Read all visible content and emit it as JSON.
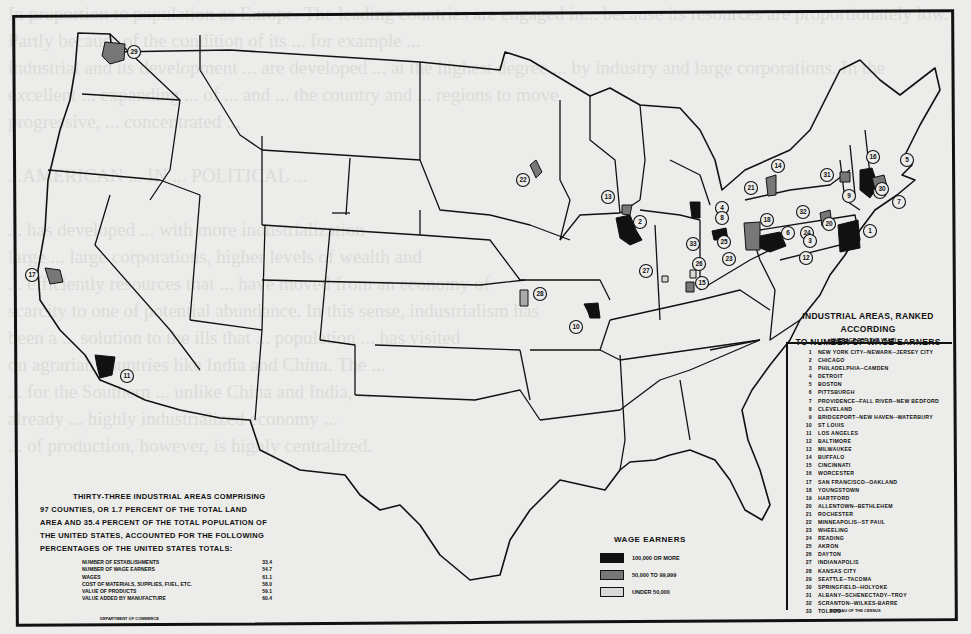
{
  "map": {
    "legend": {
      "title_line1": "INDUSTRIAL AREAS, RANKED ACCORDING",
      "title_line2": "TO NUMBER OF WAGE EARNERS",
      "subtitle": "(AVERAGE FOR THE YEAR)",
      "source": "BUREAU OF THE CENSUS",
      "areas": [
        {
          "rank": "1",
          "name": "NEW YORK CITY--NEWARK--JERSEY CITY"
        },
        {
          "rank": "2",
          "name": "CHICAGO"
        },
        {
          "rank": "3",
          "name": "PHILADELPHIA--CAMDEN"
        },
        {
          "rank": "4",
          "name": "DETROIT"
        },
        {
          "rank": "5",
          "name": "BOSTON"
        },
        {
          "rank": "6",
          "name": "PITTSBURGH"
        },
        {
          "rank": "7",
          "name": "PROVIDENCE--FALL RIVER--NEW BEDFORD"
        },
        {
          "rank": "8",
          "name": "CLEVELAND"
        },
        {
          "rank": "9",
          "name": "BRIDGEPORT--NEW HAVEN--WATERBURY"
        },
        {
          "rank": "10",
          "name": "ST LOUIS"
        },
        {
          "rank": "11",
          "name": "LOS ANGELES"
        },
        {
          "rank": "12",
          "name": "BALTIMORE"
        },
        {
          "rank": "13",
          "name": "MILWAUKEE"
        },
        {
          "rank": "14",
          "name": "BUFFALO"
        },
        {
          "rank": "15",
          "name": "CINCINNATI"
        },
        {
          "rank": "16",
          "name": "WORCESTER"
        },
        {
          "rank": "17",
          "name": "SAN FRANCISCO--OAKLAND"
        },
        {
          "rank": "18",
          "name": "YOUNGSTOWN"
        },
        {
          "rank": "19",
          "name": "HARTFORD"
        },
        {
          "rank": "20",
          "name": "ALLENTOWN--BETHLEHEM"
        },
        {
          "rank": "21",
          "name": "ROCHESTER"
        },
        {
          "rank": "22",
          "name": "MINNEAPOLIS--ST PAUL"
        },
        {
          "rank": "23",
          "name": "WHEELING"
        },
        {
          "rank": "24",
          "name": "READING"
        },
        {
          "rank": "25",
          "name": "AKRON"
        },
        {
          "rank": "26",
          "name": "DAYTON"
        },
        {
          "rank": "27",
          "name": "INDIANAPOLIS"
        },
        {
          "rank": "28",
          "name": "KANSAS CITY"
        },
        {
          "rank": "29",
          "name": "SEATTLE--TACOMA"
        },
        {
          "rank": "30",
          "name": "SPRINGFIELD--HOLYOKE"
        },
        {
          "rank": "31",
          "name": "ALBANY--SCHENECTADY--TROY"
        },
        {
          "rank": "32",
          "name": "SCRANTON--WILKES-BARRE"
        },
        {
          "rank": "33",
          "name": "TOLEDO"
        }
      ]
    },
    "summary": {
      "line1": "THIRTY-THREE INDUSTRIAL AREAS COMPRISING",
      "line2": "97 COUNTIES, OR 1.7 PERCENT OF THE TOTAL LAND",
      "line3": "AREA AND 35.4 PERCENT OF THE TOTAL POPULATION OF",
      "line4": "THE UNITED STATES, ACCOUNTED FOR THE FOLLOWING",
      "line5": "PERCENTAGES OF THE UNITED STATES TOTALS:",
      "stats": [
        {
          "label": "NUMBER OF ESTABLISHMENTS",
          "value": "33.4"
        },
        {
          "label": "NUMBER OF WAGE EARNERS",
          "value": "54.7"
        },
        {
          "label": "WAGES",
          "value": "61.1"
        },
        {
          "label": "COST OF MATERIALS, SUPPLIES, FUEL, ETC.",
          "value": "58.0"
        },
        {
          "label": "VALUE OF PRODUCTS",
          "value": "59.1"
        },
        {
          "label": "VALUE ADDED BY MANUFACTURE",
          "value": "60.4"
        }
      ],
      "source": "DEPARTMENT OF COMMERCE"
    },
    "wage_legend": {
      "title": "WAGE EARNERS",
      "items": [
        {
          "label": "100,000 OR MORE",
          "fill": "#111111"
        },
        {
          "label": "50,000 TO 99,999",
          "fill": "#777777"
        },
        {
          "label": "UNDER 50,000",
          "fill": "#d8d8d6"
        }
      ]
    },
    "markers": [
      {
        "rank": "29",
        "x": 134,
        "y": 52,
        "tier": "gray"
      },
      {
        "rank": "17",
        "x": 32,
        "y": 275,
        "tier": "gray"
      },
      {
        "rank": "11",
        "x": 127,
        "y": 376,
        "tier": "black"
      },
      {
        "rank": "22",
        "x": 523,
        "y": 180,
        "tier": "gray"
      },
      {
        "rank": "13",
        "x": 608,
        "y": 197,
        "tier": "gray"
      },
      {
        "rank": "2",
        "x": 640,
        "y": 222,
        "tier": "black"
      },
      {
        "rank": "28",
        "x": 540,
        "y": 294,
        "tier": "light"
      },
      {
        "rank": "10",
        "x": 576,
        "y": 327,
        "tier": "black"
      },
      {
        "rank": "27",
        "x": 646,
        "y": 271,
        "tier": "light"
      },
      {
        "rank": "15",
        "x": 702,
        "y": 283,
        "tier": "gray"
      },
      {
        "rank": "26",
        "x": 699,
        "y": 264,
        "tier": "light"
      },
      {
        "rank": "33",
        "x": 693,
        "y": 244,
        "tier": "light"
      },
      {
        "rank": "4",
        "x": 722,
        "y": 208,
        "tier": "black"
      },
      {
        "rank": "8",
        "x": 722,
        "y": 218,
        "tier": "black"
      },
      {
        "rank": "25",
        "x": 724,
        "y": 242,
        "tier": "gray"
      },
      {
        "rank": "23",
        "x": 729,
        "y": 259,
        "tier": "light"
      },
      {
        "rank": "18",
        "x": 767,
        "y": 220,
        "tier": "gray"
      },
      {
        "rank": "6",
        "x": 788,
        "y": 233,
        "tier": "black"
      },
      {
        "rank": "21",
        "x": 751,
        "y": 188,
        "tier": "gray"
      },
      {
        "rank": "14",
        "x": 778,
        "y": 166,
        "tier": "black"
      },
      {
        "rank": "32",
        "x": 803,
        "y": 212,
        "tier": "gray"
      },
      {
        "rank": "24",
        "x": 807,
        "y": 233,
        "tier": "light"
      },
      {
        "rank": "3",
        "x": 810,
        "y": 241,
        "tier": "black"
      },
      {
        "rank": "12",
        "x": 806,
        "y": 258,
        "tier": "black"
      },
      {
        "rank": "1",
        "x": 870,
        "y": 231,
        "tier": "black"
      },
      {
        "rank": "9",
        "x": 849,
        "y": 196,
        "tier": "black"
      },
      {
        "rank": "19",
        "x": 880,
        "y": 192,
        "tier": "gray"
      },
      {
        "rank": "31",
        "x": 827,
        "y": 175,
        "tier": "gray"
      },
      {
        "rank": "16",
        "x": 873,
        "y": 157,
        "tier": "gray"
      },
      {
        "rank": "5",
        "x": 907,
        "y": 160,
        "tier": "black"
      },
      {
        "rank": "7",
        "x": 899,
        "y": 202,
        "tier": "black"
      },
      {
        "rank": "30",
        "x": 882,
        "y": 189,
        "tier": "gray"
      },
      {
        "rank": "20",
        "x": 829,
        "y": 224,
        "tier": "gray"
      }
    ]
  },
  "page_bleed_text": "In proportion to population as Europe. The leading countries are engaged in... because its resources are proportionately low. Partly because of the condition of its ... for example ...\nindustrial and its development ... are developed ... at the highest degree ... by industry and large corporations. In the\nexcellent ... expanding ... of ... and ... the country and ... regions to move\nprogressive, ... concentrated ...\n\n...AMERICAN ... IN ... POLITICAL ...\n\n... has developed ... with more industrialization\nlarge ... large corporations, higher levels of wealth and\n... efficiently resources that ... have moved from an economy of\nscarcity to one of potential abundance. In this sense, industrialism has\nbeen a ... solution to the ills that ... population ... has visited\non agrarian countries like India and China. The ...\n... for the Southern ... unlike China and India, ...\nalready ... highly industrialized economy ...\n... of production, however, is highly centralized."
}
